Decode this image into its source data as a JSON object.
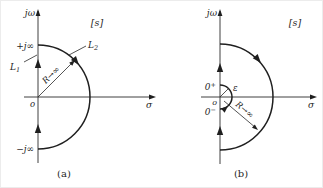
{
  "colors": {
    "ink": "#1f1f1f",
    "background": "#ffffff"
  },
  "panels": {
    "a": {
      "caption": "(a)",
      "axis_imag_label": "jω",
      "axis_real_label": "σ",
      "plane_label": "[s]",
      "plus_j_inf": "+j∞",
      "minus_j_inf": "−j∞",
      "origin_label": "o",
      "radius_label": "R→∞",
      "l1": {
        "base": "L",
        "sub": "1"
      },
      "l2": {
        "base": "L",
        "sub": "2"
      }
    },
    "b": {
      "caption": "(b)",
      "axis_imag_label": "jω",
      "axis_real_label": "σ",
      "plane_label": "[s]",
      "zero_plus": {
        "base": "0",
        "sup": "+"
      },
      "zero_minus": {
        "base": "0",
        "sup": "−"
      },
      "origin_label": "o",
      "epsilon_label": "ε",
      "radius_label": "R→∞"
    }
  }
}
